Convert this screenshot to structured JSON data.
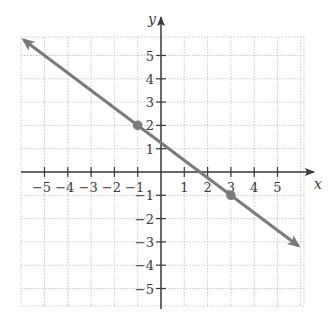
{
  "chart_data": {
    "type": "line",
    "title": "",
    "xlabel": "x",
    "ylabel": "y",
    "xlim": [
      -6,
      6
    ],
    "ylim": [
      -6,
      6
    ],
    "grid": true,
    "grid_style": "dotted",
    "x_ticks": [
      -5,
      -4,
      -3,
      -2,
      -1,
      1,
      2,
      3,
      4,
      5
    ],
    "y_ticks": [
      -5,
      -4,
      -3,
      -2,
      -1,
      1,
      2,
      3,
      4,
      5
    ],
    "x_tick_labels": [
      "−5",
      "−4",
      "−3",
      "−2",
      "−1",
      "1",
      "2",
      "3",
      "4",
      "5"
    ],
    "y_tick_labels": [
      "−5",
      "−4",
      "−3",
      "−2",
      "−1",
      "1",
      "2",
      "3",
      "4",
      "5"
    ],
    "series": [
      {
        "name": "line",
        "equation": "y = -3/4 x + 5/4",
        "slope": -0.75,
        "intercept": 1.25,
        "x_range": [
          -5.9,
          5.9
        ],
        "arrows": "both",
        "color": "#7a7a7a"
      }
    ],
    "points": [
      {
        "x": -1,
        "y": 2
      },
      {
        "x": 3,
        "y": -1
      }
    ]
  },
  "colors": {
    "axis": "#3a3a3a",
    "grid": "#c8c8c8",
    "line": "#7a7a7a",
    "point": "#7a7a7a"
  }
}
